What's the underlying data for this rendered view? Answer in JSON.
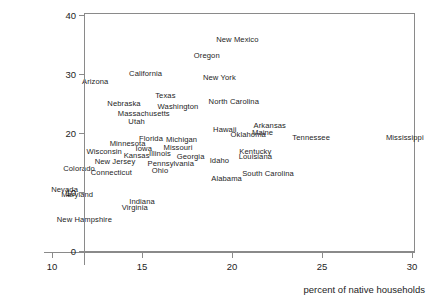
{
  "chart_data": {
    "type": "scatter",
    "title": "",
    "subtitle": "",
    "xlabel": "percent of native households",
    "ylabel": "",
    "xlim": [
      8.8,
      30.3
    ],
    "ylim": [
      0,
      41.5
    ],
    "xticks": [
      10,
      15,
      20,
      25,
      30
    ],
    "xtick_labels": [
      "10",
      "15",
      "20",
      "25",
      "30"
    ],
    "yticks": [
      0,
      10,
      20,
      30,
      40
    ],
    "ytick_labels": [
      "0",
      "10",
      "20",
      "30",
      "40"
    ],
    "grid": false,
    "legend": false,
    "legend_position": "none",
    "marker_style": "text-label",
    "note": "Each data point is rendered as the state name text centered at its (x, y) position.",
    "points": [
      {
        "label": "New Mexico",
        "x": 20.3,
        "y": 36.0
      },
      {
        "label": "Oregon",
        "x": 18.6,
        "y": 33.2
      },
      {
        "label": "California",
        "x": 15.2,
        "y": 30.2
      },
      {
        "label": "New York",
        "x": 19.3,
        "y": 29.5
      },
      {
        "label": "Arizona",
        "x": 12.4,
        "y": 28.8
      },
      {
        "label": "Texas",
        "x": 16.3,
        "y": 26.4
      },
      {
        "label": "North Carolina",
        "x": 20.1,
        "y": 25.4
      },
      {
        "label": "Nebraska",
        "x": 14.0,
        "y": 25.1
      },
      {
        "label": "Washington",
        "x": 17.0,
        "y": 24.5
      },
      {
        "label": "Massachusetts",
        "x": 15.1,
        "y": 23.4
      },
      {
        "label": "Utah",
        "x": 14.7,
        "y": 22.0
      },
      {
        "label": "Arkansas",
        "x": 22.1,
        "y": 21.4
      },
      {
        "label": "Hawaii",
        "x": 19.6,
        "y": 20.7
      },
      {
        "label": "Maine",
        "x": 21.7,
        "y": 20.1
      },
      {
        "label": "Oklahoma",
        "x": 20.9,
        "y": 19.9
      },
      {
        "label": "Tennessee",
        "x": 24.4,
        "y": 19.3
      },
      {
        "label": "Mississippi",
        "x": 29.6,
        "y": 19.3
      },
      {
        "label": "Florida",
        "x": 15.5,
        "y": 19.2
      },
      {
        "label": "Michigan",
        "x": 17.2,
        "y": 18.9
      },
      {
        "label": "Minnesota",
        "x": 14.2,
        "y": 18.3
      },
      {
        "label": "Missouri",
        "x": 17.0,
        "y": 17.6
      },
      {
        "label": "Iowa",
        "x": 15.1,
        "y": 17.5
      },
      {
        "label": "Wisconsin",
        "x": 12.9,
        "y": 17.0
      },
      {
        "label": "Kentucky",
        "x": 21.3,
        "y": 17.0
      },
      {
        "label": "Illinois",
        "x": 16.0,
        "y": 16.6
      },
      {
        "label": "Kansas",
        "x": 14.7,
        "y": 16.3
      },
      {
        "label": "Georgia",
        "x": 17.7,
        "y": 16.1
      },
      {
        "label": "Louisiana",
        "x": 21.3,
        "y": 16.1
      },
      {
        "label": "Idaho",
        "x": 19.3,
        "y": 15.5
      },
      {
        "label": "New Jersey",
        "x": 13.5,
        "y": 15.2
      },
      {
        "label": "Pennsylvania",
        "x": 16.6,
        "y": 15.0
      },
      {
        "label": "Colorado",
        "x": 11.5,
        "y": 14.0
      },
      {
        "label": "Ohio",
        "x": 16.0,
        "y": 13.7
      },
      {
        "label": "Connecticut",
        "x": 13.3,
        "y": 13.4
      },
      {
        "label": "South Carolina",
        "x": 22.0,
        "y": 13.3
      },
      {
        "label": "Alabama",
        "x": 19.7,
        "y": 12.3
      },
      {
        "label": "Nevada",
        "x": 10.7,
        "y": 10.5
      },
      {
        "label": "Maryland",
        "x": 11.4,
        "y": 9.6
      },
      {
        "label": "Indiana",
        "x": 15.0,
        "y": 8.4
      },
      {
        "label": "Virginia",
        "x": 14.6,
        "y": 7.5
      },
      {
        "label": "New Hampshire",
        "x": 11.8,
        "y": 5.4
      }
    ]
  }
}
